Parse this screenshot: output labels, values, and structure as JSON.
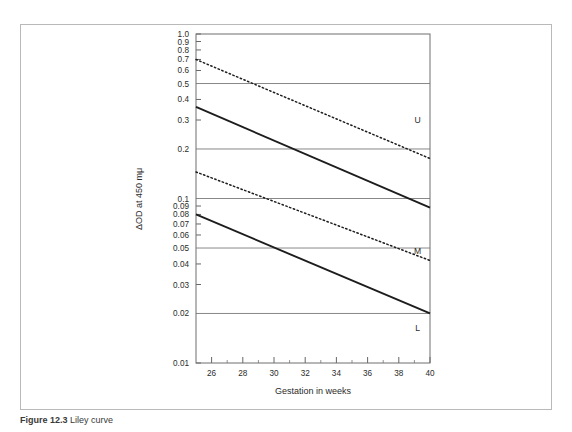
{
  "figure": {
    "caption_number": "Figure 12.3",
    "caption_text": "Liley curve"
  },
  "chart_data": {
    "type": "line",
    "title": "",
    "xlabel": "Gestation in weeks",
    "ylabel": "ΔOD at 450 mμ",
    "yscale": "log",
    "xlim": [
      25,
      40
    ],
    "ylim": [
      0.01,
      1.0
    ],
    "grid": true,
    "gridline_values": [
      0.5,
      0.2,
      0.1,
      0.05,
      0.02
    ],
    "xticks": [
      26,
      28,
      30,
      32,
      34,
      36,
      38,
      40
    ],
    "xtick_labels": [
      "26",
      "28",
      "30",
      "32",
      "34",
      "36",
      "38",
      "40"
    ],
    "xminor_ticks": [
      25,
      27,
      29,
      31,
      33,
      35,
      37,
      39
    ],
    "ytick_values": [
      1.0,
      0.9,
      0.8,
      0.7,
      0.6,
      0.5,
      0.4,
      0.3,
      0.2,
      0.1,
      0.09,
      0.08,
      0.07,
      0.06,
      0.05,
      0.04,
      0.03,
      0.02,
      0.01
    ],
    "ytick_labels": [
      "1.0",
      "0.9",
      "0.8",
      "0.7",
      "0.6",
      "0.5",
      "0.4",
      "0.3",
      "0.2",
      "0.1",
      "0.09",
      "0.08",
      "0.07",
      "0.06",
      "0.05",
      "0.04",
      "0.03",
      "0.02",
      "0.01"
    ],
    "legend_position": "right-inline",
    "series": [
      {
        "name": "upper-dotted",
        "label": "",
        "style": "dotted",
        "x": [
          25,
          40
        ],
        "values": [
          0.7,
          0.175
        ]
      },
      {
        "name": "zone-upper-solid",
        "label": "U",
        "style": "solid",
        "x": [
          25,
          40
        ],
        "values": [
          0.36,
          0.088
        ]
      },
      {
        "name": "mid-dotted",
        "label": "M",
        "style": "dotted",
        "x": [
          25,
          40
        ],
        "values": [
          0.145,
          0.042
        ]
      },
      {
        "name": "zone-lower-solid",
        "label": "L",
        "style": "solid",
        "x": [
          25,
          40
        ],
        "values": [
          0.08,
          0.02
        ]
      }
    ],
    "zone_labels": [
      {
        "text": "U",
        "x": 39.2,
        "y": 0.3
      },
      {
        "text": "M",
        "x": 39.2,
        "y": 0.048
      },
      {
        "text": "L",
        "x": 39.2,
        "y": 0.0163
      }
    ]
  }
}
